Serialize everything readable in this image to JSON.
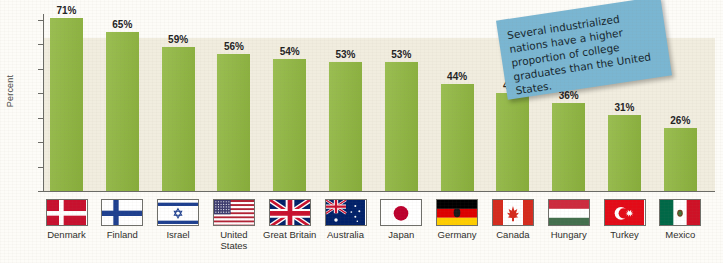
{
  "chart_data": {
    "type": "bar",
    "title": "",
    "xlabel": "",
    "ylabel": "Percent",
    "ylim": [
      0,
      70
    ],
    "yticks": [
      0,
      10,
      20,
      30,
      40,
      50,
      60,
      70
    ],
    "grid": false,
    "legend": "none",
    "categories": [
      "Denmark",
      "Finland",
      "Israel",
      "United States",
      "Great Britain",
      "Australia",
      "Japan",
      "Germany",
      "Canada",
      "Hungary",
      "Turkey",
      "Mexico"
    ],
    "values": [
      71,
      65,
      59,
      56,
      54,
      53,
      53,
      44,
      40,
      36,
      31,
      26
    ],
    "value_labels": [
      "71%",
      "65%",
      "59%",
      "56%",
      "54%",
      "53%",
      "53%",
      "44%",
      "40%",
      "36%",
      "31%",
      "26%"
    ],
    "annotations": [
      "Several industrialized nations have a higher proportion of college graduates than the United States."
    ]
  },
  "axis": {
    "y_title": "Percent",
    "y_tick_labels": [
      "0",
      "10",
      "20",
      "30",
      "40",
      "50",
      "60",
      "70"
    ]
  },
  "callout": {
    "text": "Several industrialized nations have a higher proportion of college graduates than the United States.",
    "color": "#7ab6d2"
  },
  "countries": [
    {
      "label": "Denmark",
      "label_line2": "",
      "value_label": "71%",
      "flag": "flag-denmark"
    },
    {
      "label": "Finland",
      "label_line2": "",
      "value_label": "65%",
      "flag": "flag-finland"
    },
    {
      "label": "Israel",
      "label_line2": "",
      "value_label": "59%",
      "flag": "flag-israel"
    },
    {
      "label": "United",
      "label_line2": "States",
      "value_label": "56%",
      "flag": "flag-united-states"
    },
    {
      "label": "Great Britain",
      "label_line2": "",
      "value_label": "54%",
      "flag": "flag-great-britain"
    },
    {
      "label": "Australia",
      "label_line2": "",
      "value_label": "53%",
      "flag": "flag-australia"
    },
    {
      "label": "Japan",
      "label_line2": "",
      "value_label": "53%",
      "flag": "flag-japan"
    },
    {
      "label": "Germany",
      "label_line2": "",
      "value_label": "44%",
      "flag": "flag-germany"
    },
    {
      "label": "Canada",
      "label_line2": "",
      "value_label": "40%",
      "flag": "flag-canada"
    },
    {
      "label": "Hungary",
      "label_line2": "",
      "value_label": "36%",
      "flag": "flag-hungary"
    },
    {
      "label": "Turkey",
      "label_line2": "",
      "value_label": "31%",
      "flag": "flag-turkey"
    },
    {
      "label": "Mexico",
      "label_line2": "",
      "value_label": "26%",
      "flag": "flag-mexico"
    }
  ],
  "colors": {
    "bar": "#8fb73e",
    "plot_background": "#f1eddf",
    "callout": "#7ab6d2",
    "axis": "#6b6b66"
  }
}
